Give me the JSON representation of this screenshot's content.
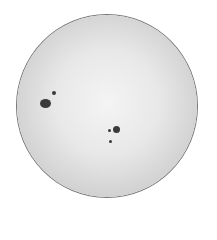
{
  "image": {
    "subject": "Sun disk with sunspots",
    "background_color": "#ffffff",
    "disk_color": "#e6e6e6",
    "limb_color": "#6a6a6a",
    "spot_color": "#3a3a3a"
  },
  "sunspots": [
    {
      "name": "large-spot-left",
      "x": 46,
      "y": 104,
      "w": 10,
      "h": 8
    },
    {
      "name": "small-spot-left",
      "x": 53,
      "y": 93,
      "w": 4,
      "h": 4
    },
    {
      "name": "spot-right",
      "x": 114,
      "y": 128,
      "w": 7,
      "h": 7
    },
    {
      "name": "small-spot-right-a",
      "x": 108,
      "y": 130,
      "w": 3,
      "h": 3
    },
    {
      "name": "small-spot-right-b",
      "x": 109,
      "y": 141,
      "w": 3,
      "h": 3
    }
  ]
}
